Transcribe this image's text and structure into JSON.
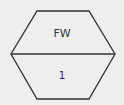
{
  "diagram": {
    "shape": "hexagon",
    "top_section": {
      "label": "FW"
    },
    "bottom_section": {
      "label": "1"
    },
    "colors": {
      "background": "#eeeeee",
      "stroke": "#333333",
      "text": "#333333"
    }
  }
}
